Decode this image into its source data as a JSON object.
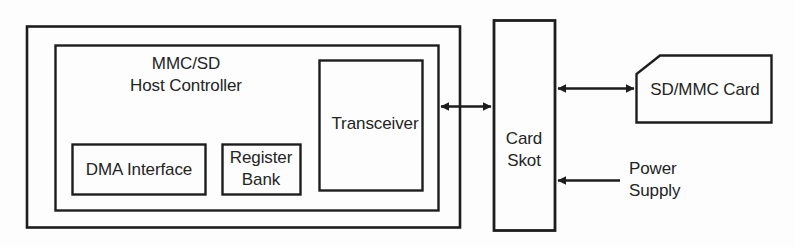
{
  "diagram": {
    "background_color": "#fdfdfd",
    "stroke_color": "#1d1d1d",
    "text_color": "#242424",
    "blocks": {
      "outer_system": {
        "label": ""
      },
      "host_controller": {
        "label_line1": "MMC/SD",
        "label_line2": "Host Controller"
      },
      "dma_interface": {
        "label": "DMA Interface"
      },
      "register_bank": {
        "label_line1": "Register",
        "label_line2": "Bank"
      },
      "transceiver": {
        "label": "Transceiver"
      },
      "card_slot": {
        "label_line1": "Card",
        "label_line2": "Skot"
      },
      "sd_mmc_card": {
        "label": "SD/MMC Card"
      }
    },
    "connections": {
      "transceiver_to_card_slot": {
        "label": "",
        "type": "bidirectional"
      },
      "card_slot_to_card": {
        "label": "",
        "type": "bidirectional"
      },
      "power_to_card_slot": {
        "label_line1": "Power",
        "label_line2": "Supply",
        "type": "unidirectional"
      }
    }
  }
}
